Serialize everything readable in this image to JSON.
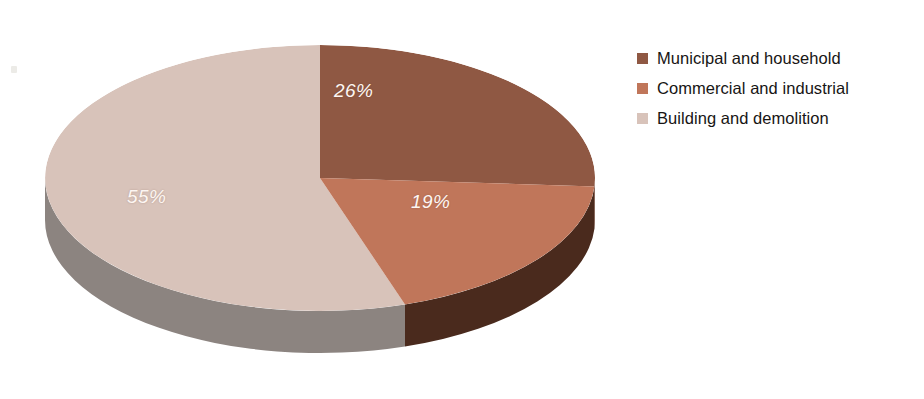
{
  "chart_data": {
    "type": "pie",
    "title": "",
    "subtitle": "",
    "xlabel": "",
    "ylabel": "",
    "three_d": true,
    "start_angle_deg": 0,
    "direction": "clockwise",
    "legend_position": "right",
    "grid": false,
    "categories": [
      "Municipal and household",
      "Commercial and industrial",
      "Building and demolition"
    ],
    "values": [
      26,
      19,
      55
    ],
    "value_unit": "%",
    "data_labels": [
      "26%",
      "19%",
      "55%"
    ],
    "colors": [
      "#8f5843",
      "#c0765a",
      "#d8c3ba"
    ],
    "side_colors": [
      "#6b3a2a",
      "#4a2a1d",
      "#8c8480"
    ],
    "slices": [
      {
        "label": "Municipal and household",
        "value": 26,
        "display": "26%",
        "color": "#8f5843",
        "side_color": "#6b3a2a"
      },
      {
        "label": "Commercial and industrial",
        "value": 19,
        "display": "19%",
        "color": "#c0765a",
        "side_color": "#4a2a1d"
      },
      {
        "label": "Building and demolition",
        "value": 55,
        "display": "55%",
        "color": "#d8c3ba",
        "side_color": "#8c8480"
      }
    ]
  },
  "legend": {
    "items": [
      {
        "label": "Municipal and household",
        "color": "#8f5843"
      },
      {
        "label": "Commercial and industrial",
        "color": "#c0765a"
      },
      {
        "label": "Building and demolition",
        "color": "#d8c3ba"
      }
    ]
  },
  "labels": {
    "slice_0": "26%",
    "slice_1": "19%",
    "slice_2": "55%"
  },
  "colors": {
    "background": "#ffffff",
    "label_text": "#fdf6f2",
    "legend_text": "#171514",
    "slice_municipal": "#8f5843",
    "slice_commercial": "#c0765a",
    "slice_building": "#d8c3ba"
  }
}
